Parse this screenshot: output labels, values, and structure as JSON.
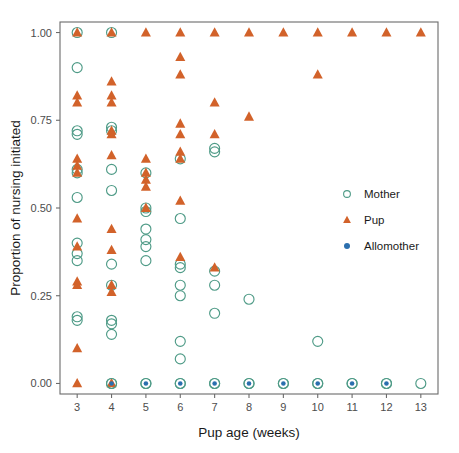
{
  "chart_data": {
    "type": "scatter",
    "title": "",
    "xlabel": "Pup age (weeks)",
    "ylabel": "Proportion of nursing initiated",
    "xlim": [
      2.5,
      13.5
    ],
    "ylim": [
      -0.03,
      1.03
    ],
    "xticks": [
      3,
      4,
      5,
      6,
      7,
      8,
      9,
      10,
      11,
      12,
      13
    ],
    "xticklabels": [
      "3",
      "4",
      "5",
      "6",
      "7",
      "8",
      "9",
      "10",
      "11",
      "12",
      "13"
    ],
    "yticks": [
      0.0,
      0.25,
      0.5,
      0.75,
      1.0
    ],
    "yticklabels": [
      "0.00",
      "0.25",
      "0.50",
      "0.75",
      "1.00"
    ],
    "grid": false,
    "legend_position": "right-middle",
    "legend": [
      {
        "name": "Mother",
        "marker": "open-circle",
        "color": "#4f9b87"
      },
      {
        "name": "Pup",
        "marker": "filled-triangle",
        "color": "#d2622a"
      },
      {
        "name": "Allomother",
        "marker": "filled-circle",
        "color": "#2b6fae"
      }
    ],
    "series": [
      {
        "name": "Mother",
        "marker": "open-circle",
        "color": "#4f9b87",
        "points": [
          [
            3,
            1.0
          ],
          [
            3,
            0.9
          ],
          [
            3,
            0.72
          ],
          [
            3,
            0.71
          ],
          [
            3,
            0.61
          ],
          [
            3,
            0.6
          ],
          [
            3,
            0.53
          ],
          [
            3,
            0.4
          ],
          [
            3,
            0.37
          ],
          [
            3,
            0.35
          ],
          [
            3,
            0.19
          ],
          [
            3,
            0.18
          ],
          [
            4,
            1.0
          ],
          [
            4,
            0.73
          ],
          [
            4,
            0.72
          ],
          [
            4,
            0.61
          ],
          [
            4,
            0.55
          ],
          [
            4,
            0.34
          ],
          [
            4,
            0.28
          ],
          [
            4,
            0.18
          ],
          [
            4,
            0.17
          ],
          [
            4,
            0.14
          ],
          [
            4,
            0.0
          ],
          [
            5,
            0.6
          ],
          [
            5,
            0.5
          ],
          [
            5,
            0.49
          ],
          [
            5,
            0.44
          ],
          [
            5,
            0.41
          ],
          [
            5,
            0.39
          ],
          [
            5,
            0.35
          ],
          [
            5,
            0.0
          ],
          [
            6,
            0.64
          ],
          [
            6,
            0.47
          ],
          [
            6,
            0.34
          ],
          [
            6,
            0.33
          ],
          [
            6,
            0.28
          ],
          [
            6,
            0.25
          ],
          [
            6,
            0.12
          ],
          [
            6,
            0.07
          ],
          [
            6,
            0.0
          ],
          [
            7,
            0.67
          ],
          [
            7,
            0.66
          ],
          [
            7,
            0.32
          ],
          [
            7,
            0.28
          ],
          [
            7,
            0.2
          ],
          [
            7,
            0.0
          ],
          [
            8,
            0.24
          ],
          [
            8,
            0.0
          ],
          [
            9,
            0.0
          ],
          [
            10,
            0.12
          ],
          [
            10,
            0.0
          ],
          [
            11,
            0.0
          ],
          [
            12,
            0.0
          ],
          [
            13,
            0.0
          ]
        ]
      },
      {
        "name": "Pup",
        "marker": "filled-triangle",
        "color": "#d2622a",
        "points": [
          [
            3,
            1.0
          ],
          [
            3,
            0.82
          ],
          [
            3,
            0.8
          ],
          [
            3,
            0.64
          ],
          [
            3,
            0.62
          ],
          [
            3,
            0.6
          ],
          [
            3,
            0.47
          ],
          [
            3,
            0.39
          ],
          [
            3,
            0.29
          ],
          [
            3,
            0.28
          ],
          [
            3,
            0.1
          ],
          [
            3,
            0.0
          ],
          [
            4,
            1.0
          ],
          [
            4,
            0.86
          ],
          [
            4,
            0.82
          ],
          [
            4,
            0.8
          ],
          [
            4,
            0.72
          ],
          [
            4,
            0.71
          ],
          [
            4,
            0.65
          ],
          [
            4,
            0.44
          ],
          [
            4,
            0.38
          ],
          [
            4,
            0.28
          ],
          [
            4,
            0.26
          ],
          [
            4,
            0.0
          ],
          [
            5,
            1.0
          ],
          [
            5,
            0.64
          ],
          [
            5,
            0.6
          ],
          [
            5,
            0.58
          ],
          [
            5,
            0.56
          ],
          [
            5,
            0.5
          ],
          [
            6,
            1.0
          ],
          [
            6,
            0.93
          ],
          [
            6,
            0.88
          ],
          [
            6,
            0.74
          ],
          [
            6,
            0.71
          ],
          [
            6,
            0.66
          ],
          [
            6,
            0.64
          ],
          [
            6,
            0.52
          ],
          [
            6,
            0.36
          ],
          [
            7,
            1.0
          ],
          [
            7,
            0.8
          ],
          [
            7,
            0.71
          ],
          [
            7,
            0.33
          ],
          [
            8,
            1.0
          ],
          [
            8,
            0.76
          ],
          [
            9,
            1.0
          ],
          [
            10,
            1.0
          ],
          [
            10,
            0.88
          ],
          [
            11,
            1.0
          ],
          [
            12,
            1.0
          ],
          [
            13,
            1.0
          ]
        ]
      },
      {
        "name": "Allomother",
        "marker": "filled-circle",
        "color": "#2b6fae",
        "points": [
          [
            4,
            0.0
          ],
          [
            5,
            0.0
          ],
          [
            6,
            0.0
          ],
          [
            7,
            0.0
          ],
          [
            8,
            0.0
          ],
          [
            9,
            0.0
          ],
          [
            10,
            0.0
          ],
          [
            11,
            0.0
          ],
          [
            12,
            0.0
          ]
        ]
      }
    ]
  },
  "axes": {
    "x_title": "Pup age (weeks)",
    "y_title": "Proportion of nursing initiated"
  }
}
